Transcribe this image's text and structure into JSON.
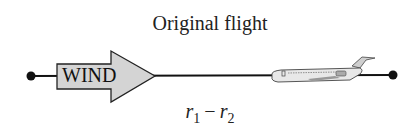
{
  "diagram": {
    "title": "Original flight",
    "arrow_label": "WIND",
    "resultant": {
      "var1": "r",
      "sub1": "1",
      "operator": "−",
      "var2": "r",
      "sub2": "2"
    },
    "colors": {
      "line": "#111111",
      "arrow_fill": "#d4d4d4",
      "plane_fill": "#e6e6e6"
    }
  }
}
